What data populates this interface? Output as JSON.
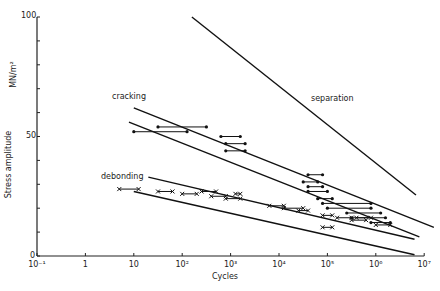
{
  "chart_data": {
    "type": "line",
    "title": "",
    "xlabel": "Cycles",
    "ylabel": "Stress amplitude",
    "yunit": "MN/m²",
    "xscale": "log",
    "xlim": [
      -1,
      7
    ],
    "ylim": [
      0,
      100
    ],
    "x_ticks": [
      "10⁻¹",
      "1",
      "10",
      "10²",
      "10³",
      "10⁴",
      "10⁵",
      "10⁶",
      "10⁷"
    ],
    "y_ticks": [
      "0",
      "50",
      "100"
    ],
    "grid": false,
    "annotations": [
      "cracking",
      "debonding",
      "separation"
    ],
    "series": [
      {
        "name": "separation",
        "style": "line",
        "points": [
          [
            2.2,
            100
          ],
          [
            6.83,
            25.5
          ]
        ]
      },
      {
        "name": "cracking upper bound",
        "style": "line",
        "points": [
          [
            1.0,
            62
          ],
          [
            7.2,
            12
          ]
        ]
      },
      {
        "name": "cracking lower bound",
        "style": "line",
        "points": [
          [
            0.9,
            56
          ],
          [
            6.9,
            8
          ]
        ]
      },
      {
        "name": "debonding upper bound",
        "style": "line",
        "points": [
          [
            1.3,
            33
          ],
          [
            6.8,
            7
          ]
        ]
      },
      {
        "name": "debonding lower bound",
        "style": "line",
        "points": [
          [
            1.0,
            27
          ],
          [
            6.8,
            0.5
          ]
        ]
      },
      {
        "name": "cracking data (dot ranges)",
        "style": "range-dot",
        "ranges": [
          [
            [
              1.0,
              52
            ],
            [
              2.1,
              52
            ]
          ],
          [
            [
              1.5,
              54
            ],
            [
              2.5,
              54
            ]
          ],
          [
            [
              2.8,
              50
            ],
            [
              3.2,
              50
            ]
          ],
          [
            [
              2.9,
              47
            ],
            [
              3.3,
              47
            ]
          ],
          [
            [
              2.9,
              44
            ],
            [
              3.3,
              44
            ]
          ],
          [
            [
              4.6,
              34
            ],
            [
              4.9,
              34
            ]
          ],
          [
            [
              4.5,
              31
            ],
            [
              4.8,
              31
            ]
          ],
          [
            [
              4.6,
              29
            ],
            [
              4.9,
              29
            ]
          ],
          [
            [
              4.6,
              27
            ],
            [
              5.0,
              27
            ]
          ],
          [
            [
              4.8,
              24
            ],
            [
              5.1,
              24
            ]
          ],
          [
            [
              4.9,
              22
            ],
            [
              5.9,
              22
            ]
          ],
          [
            [
              5.0,
              20
            ],
            [
              5.9,
              20
            ]
          ],
          [
            [
              5.4,
              18
            ],
            [
              6.1,
              18
            ]
          ],
          [
            [
              5.5,
              16
            ],
            [
              6.2,
              16
            ]
          ],
          [
            [
              5.9,
              14
            ],
            [
              6.3,
              14
            ]
          ]
        ]
      },
      {
        "name": "debonding data (cross ranges)",
        "style": "range-cross",
        "ranges": [
          [
            [
              0.7,
              28
            ],
            [
              1.1,
              28
            ]
          ],
          [
            [
              1.5,
              27
            ],
            [
              1.8,
              27
            ]
          ],
          [
            [
              2.0,
              26
            ],
            [
              2.3,
              26
            ]
          ],
          [
            [
              2.4,
              27
            ],
            [
              2.7,
              27
            ]
          ],
          [
            [
              2.6,
              25
            ],
            [
              2.9,
              25
            ]
          ],
          [
            [
              2.9,
              24
            ],
            [
              3.2,
              24
            ]
          ],
          [
            [
              3.1,
              26
            ],
            [
              3.2,
              26
            ]
          ],
          [
            [
              3.8,
              21
            ],
            [
              4.1,
              21
            ]
          ],
          [
            [
              4.1,
              20
            ],
            [
              4.5,
              20
            ]
          ],
          [
            [
              4.4,
              19
            ],
            [
              4.6,
              19
            ]
          ],
          [
            [
              4.9,
              17
            ],
            [
              5.1,
              17
            ]
          ],
          [
            [
              5.2,
              16
            ],
            [
              5.5,
              16
            ]
          ],
          [
            [
              5.5,
              15
            ],
            [
              5.8,
              15
            ]
          ],
          [
            [
              5.6,
              16
            ],
            [
              5.9,
              16
            ]
          ],
          [
            [
              4.9,
              12
            ],
            [
              5.1,
              12
            ]
          ],
          [
            [
              6.0,
              13
            ],
            [
              6.3,
              13
            ]
          ]
        ]
      }
    ]
  },
  "labels": {
    "y_axis_title": "Stress amplitude",
    "y_axis_unit": "MN/m²",
    "x_axis_title": "Cycles",
    "cracking": "cracking",
    "debonding": "debonding",
    "separation": "separation",
    "y_tick_100": "100",
    "y_tick_50": "50",
    "y_tick_0": "0"
  }
}
